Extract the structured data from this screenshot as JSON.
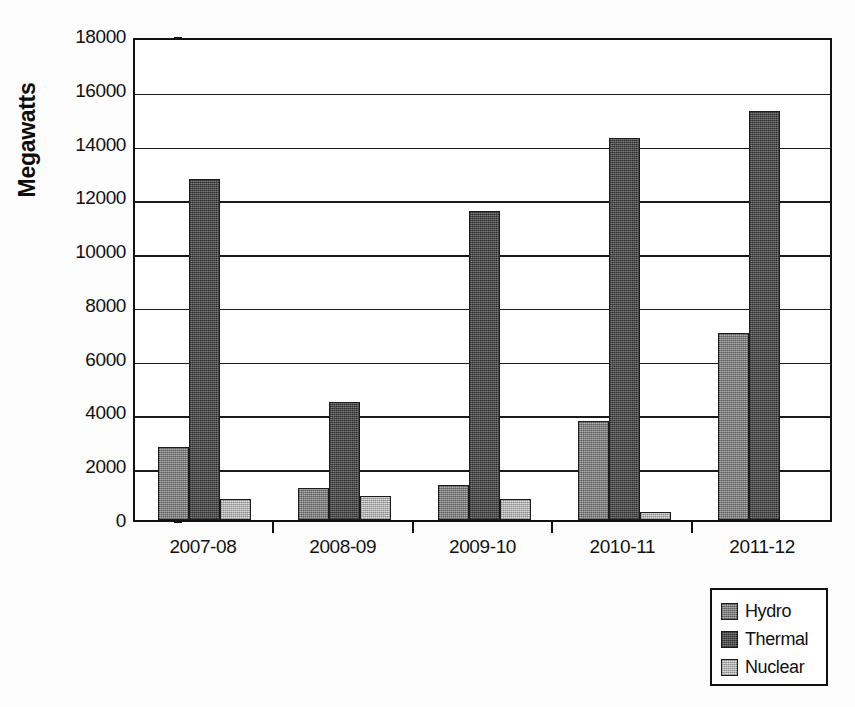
{
  "chart_data": {
    "type": "bar",
    "title": "",
    "subtitle": "",
    "xlabel": "",
    "ylabel": "Megawatts",
    "categories": [
      "2007-08",
      "2008-09",
      "2009-10",
      "2010-11",
      "2011-12"
    ],
    "series": [
      {
        "name": "Hydro",
        "color": "#8a8a8a",
        "values": [
          2700,
          1200,
          1300,
          3700,
          6950
        ]
      },
      {
        "name": "Thermal",
        "color": "#515151",
        "values": [
          12700,
          4400,
          11500,
          14200,
          15200
        ]
      },
      {
        "name": "Nuclear",
        "color": "#bdbdbd",
        "values": [
          800,
          880,
          800,
          300,
          0
        ]
      }
    ],
    "ylim": [
      0,
      18000
    ],
    "ytick_step": 2000,
    "yticks": [
      0,
      2000,
      4000,
      6000,
      8000,
      10000,
      12000,
      14000,
      16000,
      18000
    ],
    "ytick_labels": [
      "0",
      "2000",
      "4000",
      "6000",
      "8000",
      "10000",
      "12000",
      "14000",
      "16000",
      "18000"
    ],
    "grid": true,
    "grid_axis": "y",
    "legend_position": "bottom-right",
    "legend_entries": [
      "Hydro",
      "Thermal",
      "Nuclear"
    ],
    "annotations": []
  }
}
